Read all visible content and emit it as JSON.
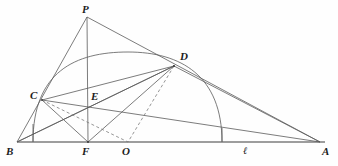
{
  "figure": {
    "type": "geometry-diagram",
    "width": 338,
    "height": 166,
    "background_color": "#fefefe",
    "stroke_color": "#4a4a4a",
    "baseline_color": "#8a8a8a",
    "label_color": "#1c1c1c"
  },
  "points": {
    "B": {
      "label": "B",
      "x": 17,
      "y": 142,
      "label_x": 7,
      "label_y": 146
    },
    "F": {
      "label": "F",
      "x": 88,
      "y": 142,
      "label_x": 82,
      "label_y": 146
    },
    "O": {
      "label": "O",
      "x": 128,
      "y": 142,
      "label_x": 122,
      "label_y": 146
    },
    "A": {
      "label": "A",
      "x": 320,
      "y": 142,
      "label_x": 320,
      "label_y": 146
    },
    "P": {
      "label": "P",
      "x": 87,
      "y": 17,
      "label_x": 82,
      "label_y": 4
    },
    "D": {
      "label": "D",
      "x": 174,
      "y": 66,
      "label_x": 180,
      "label_y": 52
    },
    "C": {
      "label": "C",
      "x": 42,
      "y": 100,
      "label_x": 31,
      "label_y": 91
    },
    "E": {
      "label": "E",
      "x": 87,
      "y": 103,
      "label_x": 91,
      "label_y": 92
    },
    "L": {
      "label": "ℓ",
      "x": 246,
      "y": 142,
      "label_x": 243,
      "label_y": 146
    }
  },
  "segments": [
    {
      "name": "baseline-B-A",
      "from": "B",
      "to": "A",
      "style": "solid",
      "weight": "heavy"
    },
    {
      "name": "B-to-P",
      "from": "B",
      "to": "P",
      "style": "solid",
      "weight": "normal"
    },
    {
      "name": "P-to-F",
      "from": "P",
      "to": "F",
      "style": "solid",
      "weight": "normal"
    },
    {
      "name": "P-to-A",
      "from": "P",
      "to": "A",
      "style": "solid",
      "weight": "normal"
    },
    {
      "name": "B-to-D",
      "from": "B",
      "to": "D",
      "style": "solid",
      "weight": "normal"
    },
    {
      "name": "C-to-D",
      "from": "C",
      "to": "D",
      "style": "solid",
      "weight": "normal"
    },
    {
      "name": "C-to-A",
      "from": "C",
      "to": "A",
      "style": "solid",
      "weight": "normal"
    },
    {
      "name": "D-to-A",
      "from": "D",
      "to": "A",
      "style": "solid",
      "weight": "normal"
    },
    {
      "name": "D-to-F",
      "from": "D",
      "to": "F",
      "style": "solid",
      "weight": "normal"
    },
    {
      "name": "D-to-B",
      "from": "D",
      "to": "B",
      "style": "solid",
      "weight": "normal"
    },
    {
      "name": "C-to-F",
      "from": "C",
      "to": "F",
      "style": "solid",
      "weight": "normal"
    },
    {
      "name": "B-to-C",
      "from": "B",
      "to": "C",
      "style": "solid",
      "weight": "normal"
    },
    {
      "name": "C-to-O-dashed",
      "from": "C",
      "to": "O",
      "style": "dashed",
      "weight": "normal"
    },
    {
      "name": "D-to-O-dashed",
      "from": "D",
      "to": "O",
      "style": "dashed",
      "weight": "normal"
    },
    {
      "name": "foot-left-tick",
      "from_xy": [
        33,
        124
      ],
      "to_xy": [
        33,
        142
      ],
      "style": "solid",
      "weight": "normal"
    },
    {
      "name": "foot-right-tick",
      "from_xy": [
        222,
        128
      ],
      "to_xy": [
        222,
        142
      ],
      "style": "solid",
      "weight": "normal"
    }
  ],
  "arcs": [
    {
      "name": "main-circle-arc",
      "description": "large arc through C, apex and D down to baseline near A-side",
      "start": [
        33,
        142
      ],
      "apex": [
        128,
        52
      ],
      "end": [
        222,
        142
      ],
      "passes_through": [
        "C",
        "D"
      ]
    }
  ],
  "labels_order": [
    "P",
    "D",
    "C",
    "E",
    "B",
    "F",
    "O",
    "ℓ",
    "A"
  ]
}
